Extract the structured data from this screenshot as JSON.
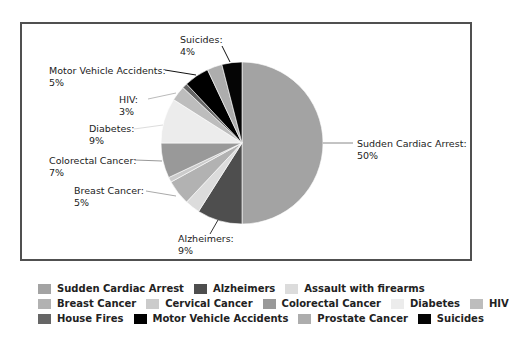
{
  "chart_data": {
    "type": "pie",
    "title": "",
    "categories": [
      "Sudden Cardiac Arrest",
      "Alzheimers",
      "Assault with firearms",
      "Breast Cancer",
      "Cervical Cancer",
      "Colorectal Cancer",
      "Diabetes",
      "HIV",
      "House Fires",
      "Motor Vehicle Accidents",
      "Prostate Cancer",
      "Suicides"
    ],
    "values": [
      50,
      9,
      3,
      5,
      1,
      7,
      9,
      3,
      1,
      5,
      3,
      4
    ],
    "unit": "%",
    "colors": [
      "#a3a3a3",
      "#4e4e4e",
      "#dcdcdc",
      "#b2b2b2",
      "#cbcbcb",
      "#999999",
      "#ececec",
      "#bdbdbd",
      "#666666",
      "#000000",
      "#adadad",
      "#050505"
    ],
    "data_labels": [
      {
        "name": "Sudden Cardiac Arrest:",
        "value": "50%"
      },
      {
        "name": "Alzheimers:",
        "value": "9%"
      },
      {
        "name": "Breast Cancer:",
        "value": "5%"
      },
      {
        "name": "Colorectal Cancer:",
        "value": "7%"
      },
      {
        "name": "Diabetes:",
        "value": "9%"
      },
      {
        "name": "HIV:",
        "value": "3%"
      },
      {
        "name": "Motor Vehicle Accidents:",
        "value": "5%"
      },
      {
        "name": "Suicides:",
        "value": "4%"
      }
    ],
    "legend_position": "bottom",
    "start_angle_deg": 0,
    "direction": "clockwise"
  },
  "labels": {
    "sca": {
      "name": "Sudden Cardiac Arrest:",
      "value": "50%"
    },
    "alz": {
      "name": "Alzheimers:",
      "value": "9%"
    },
    "breast": {
      "name": "Breast Cancer:",
      "value": "5%"
    },
    "colorectal": {
      "name": "Colorectal Cancer:",
      "value": "7%"
    },
    "diabetes": {
      "name": "Diabetes:",
      "value": "9%"
    },
    "hiv": {
      "name": "HIV:",
      "value": "3%"
    },
    "mva": {
      "name": "Motor Vehicle Accidents:",
      "value": "5%"
    },
    "suicides": {
      "name": "Suicides:",
      "value": "4%"
    }
  },
  "legend": {
    "rows": [
      [
        {
          "label": "Sudden Cardiac Arrest",
          "color": "#a3a3a3"
        },
        {
          "label": "Alzheimers",
          "color": "#4e4e4e"
        },
        {
          "label": "Assault with firearms",
          "color": "#dcdcdc"
        }
      ],
      [
        {
          "label": "Breast Cancer",
          "color": "#b2b2b2"
        },
        {
          "label": "Cervical Cancer",
          "color": "#cbcbcb"
        },
        {
          "label": "Colorectal Cancer",
          "color": "#999999"
        },
        {
          "label": "Diabetes",
          "color": "#ececec"
        },
        {
          "label": "HIV",
          "color": "#bdbdbd"
        }
      ],
      [
        {
          "label": "House Fires",
          "color": "#666666"
        },
        {
          "label": "Motor Vehicle Accidents",
          "color": "#000000"
        },
        {
          "label": "Prostate Cancer",
          "color": "#adadad"
        },
        {
          "label": "Suicides",
          "color": "#050505"
        }
      ]
    ]
  }
}
